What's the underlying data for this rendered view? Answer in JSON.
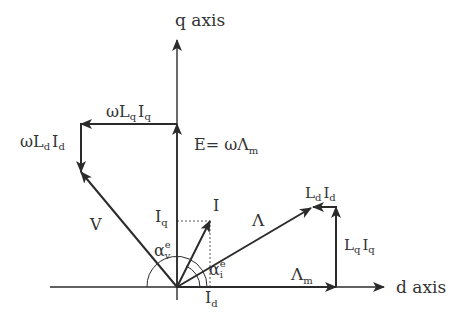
{
  "diagram": {
    "colors": {
      "line": "#2b2b2b",
      "text": "#333333",
      "background": "#ffffff"
    },
    "axes": {
      "q_axis": {
        "label": "q axis"
      },
      "d_axis": {
        "label": "d axis"
      }
    },
    "labels": {
      "omega_lq_iq": {
        "prefix": "ωL",
        "sub1": "q",
        "mid": "I",
        "sub2": "q"
      },
      "omega_ld_id": {
        "prefix": "ωL",
        "sub1": "d",
        "mid": "I",
        "sub2": "d"
      },
      "emf": {
        "prefix": "E= ωΛ",
        "sub": "m"
      },
      "voltage": "V",
      "current": "I",
      "iq": {
        "main": "I",
        "sub": "q"
      },
      "id": {
        "main": "I",
        "sub": "d"
      },
      "alpha_v": {
        "main": "α",
        "sup": "e",
        "sub": "v"
      },
      "alpha_i": {
        "main": "α",
        "sup": "e",
        "sub": "i"
      },
      "flux": "Λ",
      "flux_m": {
        "main": "Λ",
        "sub": "m"
      },
      "ld_id": {
        "prefix": "L",
        "sub1": "d",
        "mid": "I",
        "sub2": "d"
      },
      "lq_iq": {
        "prefix": "L",
        "sub1": "q",
        "mid": "I",
        "sub2": "q"
      }
    },
    "vectors": [
      {
        "name": "E",
        "from": [
          177,
          287
        ],
        "to": [
          177,
          124
        ]
      },
      {
        "name": "omegaLqIq",
        "from": [
          177,
          124
        ],
        "to": [
          81,
          124
        ]
      },
      {
        "name": "omegaLdId",
        "from": [
          81,
          124
        ],
        "to": [
          81,
          172
        ]
      },
      {
        "name": "V",
        "from": [
          177,
          287
        ],
        "to": [
          81,
          172
        ]
      },
      {
        "name": "I",
        "from": [
          177,
          287
        ],
        "to": [
          210,
          221
        ]
      },
      {
        "name": "Lambda_m",
        "from": [
          177,
          287
        ],
        "to": [
          336,
          287
        ]
      },
      {
        "name": "LqIq",
        "from": [
          336,
          287
        ],
        "to": [
          336,
          207
        ]
      },
      {
        "name": "LdId",
        "from": [
          336,
          207
        ],
        "to": [
          313,
          207
        ]
      },
      {
        "name": "Lambda",
        "from": [
          177,
          287
        ],
        "to": [
          311,
          208
        ]
      }
    ]
  }
}
